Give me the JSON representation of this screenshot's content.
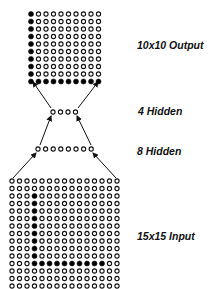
{
  "diagram": {
    "colors": {
      "node_stroke": "#111111",
      "node_fill_active": "#000000",
      "node_fill_inactive": "#ffffff",
      "arrow": "#111111",
      "background": "#ffffff"
    }
  },
  "layers": [
    {
      "id": "output",
      "label": "10x10 Output",
      "rows": 10,
      "cols": 10,
      "origin": [
        31,
        14
      ],
      "spacing": 7.5,
      "active_pattern": "column 0 (all rows) and row 9 (all columns)",
      "active": [
        [
          0,
          0
        ],
        [
          1,
          0
        ],
        [
          2,
          0
        ],
        [
          3,
          0
        ],
        [
          4,
          0
        ],
        [
          5,
          0
        ],
        [
          6,
          0
        ],
        [
          7,
          0
        ],
        [
          8,
          0
        ],
        [
          9,
          0
        ],
        [
          9,
          1
        ],
        [
          9,
          2
        ],
        [
          9,
          3
        ],
        [
          9,
          4
        ],
        [
          9,
          5
        ],
        [
          9,
          6
        ],
        [
          9,
          7
        ],
        [
          9,
          8
        ],
        [
          9,
          9
        ]
      ],
      "label_pos": [
        137,
        40
      ]
    },
    {
      "id": "hidden4",
      "label": "4 Hidden",
      "rows": 1,
      "cols": 4,
      "origin": [
        53,
        112
      ],
      "spacing": 7.5,
      "active": [],
      "label_pos": [
        138,
        106
      ]
    },
    {
      "id": "hidden8",
      "label": "8 Hidden",
      "rows": 1,
      "cols": 8,
      "origin": [
        38,
        149
      ],
      "spacing": 7.6,
      "active": [],
      "label_pos": [
        137,
        146
      ]
    },
    {
      "id": "input",
      "label": "15x15 Input",
      "rows": 15,
      "cols": 15,
      "origin": [
        12,
        181
      ],
      "spacing": 7.5,
      "active_pattern": "column 3 rows 2-11 and row 11 columns 3-12",
      "active": [
        [
          2,
          3
        ],
        [
          3,
          3
        ],
        [
          4,
          3
        ],
        [
          5,
          3
        ],
        [
          6,
          3
        ],
        [
          7,
          3
        ],
        [
          8,
          3
        ],
        [
          9,
          3
        ],
        [
          10,
          3
        ],
        [
          11,
          3
        ],
        [
          11,
          4
        ],
        [
          11,
          5
        ],
        [
          11,
          6
        ],
        [
          11,
          7
        ],
        [
          11,
          8
        ],
        [
          11,
          9
        ],
        [
          11,
          10
        ],
        [
          11,
          11
        ],
        [
          11,
          12
        ]
      ],
      "label_pos": [
        137,
        231
      ]
    }
  ],
  "arrows": [
    {
      "from": [
        13,
        178
      ],
      "to": [
        36,
        153
      ]
    },
    {
      "from": [
        116,
        178
      ],
      "to": [
        93,
        153
      ]
    },
    {
      "from": [
        40,
        145
      ],
      "to": [
        51,
        116
      ]
    },
    {
      "from": [
        91,
        145
      ],
      "to": [
        77,
        116
      ]
    },
    {
      "from": [
        51,
        108
      ],
      "to": [
        33,
        82
      ]
    },
    {
      "from": [
        78,
        108
      ],
      "to": [
        98,
        82
      ]
    }
  ]
}
